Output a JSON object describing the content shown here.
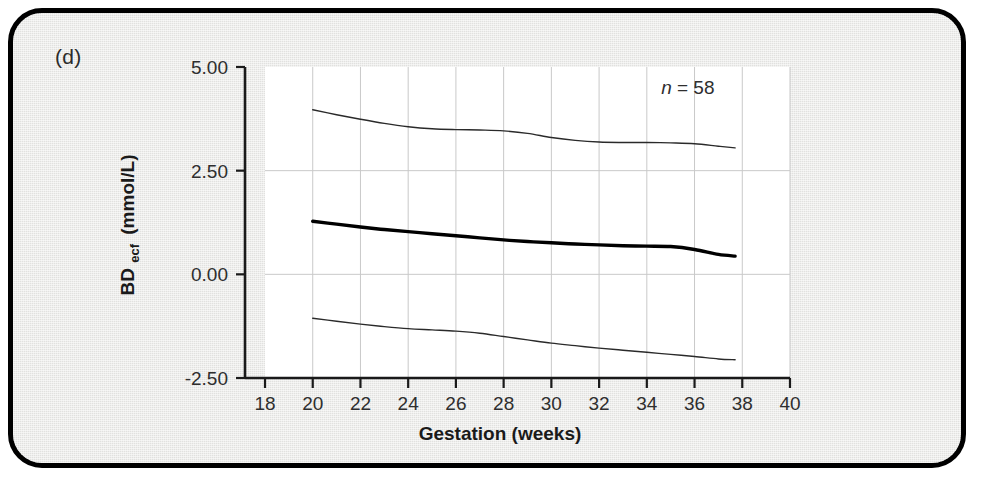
{
  "panel": {
    "label": "(d)",
    "background_color": "#e9e9e7",
    "border_color": "#000000",
    "plot_background_color": "#ffffff"
  },
  "chart_data": {
    "type": "line",
    "title": "",
    "subtitle": "",
    "xlabel": "Gestation (weeks)",
    "ylabel": "BD",
    "ylabel_subscript": "ecf",
    "ylabel_units": "(mmol/L)",
    "ylabel_full": "BD ecf (mmol/L)",
    "xlim": [
      18,
      40
    ],
    "ylim": [
      -2.5,
      5.0
    ],
    "xticks": [
      18,
      20,
      22,
      24,
      26,
      28,
      30,
      32,
      34,
      36,
      38,
      40
    ],
    "xtick_labels": [
      "18",
      "20",
      "22",
      "24",
      "26",
      "28",
      "30",
      "32",
      "34",
      "36",
      "38",
      "40"
    ],
    "yticks": [
      -2.5,
      0.0,
      2.5,
      5.0
    ],
    "ytick_labels": [
      "-2.50",
      "0.00",
      "2.50",
      "5.00"
    ],
    "grid": {
      "vertical": true,
      "horizontal": true,
      "horizontal_values": [
        0.0,
        2.5
      ],
      "color": "#c9c9c9"
    },
    "legend": {
      "visible": false,
      "position": "none"
    },
    "annotations": [
      {
        "name": "sample-size",
        "text_italic": "n",
        "text_rest": " = 58",
        "text": "n = 58",
        "x": 34.6,
        "y": 4.35
      }
    ],
    "x": [
      20.0,
      21.0,
      22.0,
      23.0,
      24.0,
      25.0,
      26.0,
      27.0,
      28.0,
      29.0,
      30.0,
      31.0,
      32.0,
      33.0,
      34.0,
      35.0,
      36.0,
      37.0,
      37.7
    ],
    "series": [
      {
        "name": "upper-centile",
        "label": "Upper reference limit",
        "style": "thin",
        "color": "#2a2a2a",
        "width": 1.4,
        "values": [
          3.97,
          3.85,
          3.74,
          3.64,
          3.56,
          3.51,
          3.49,
          3.48,
          3.46,
          3.4,
          3.3,
          3.23,
          3.19,
          3.18,
          3.18,
          3.17,
          3.15,
          3.09,
          3.05
        ]
      },
      {
        "name": "median",
        "label": "Median",
        "style": "thick",
        "color": "#000000",
        "width": 3.4,
        "values": [
          1.28,
          1.21,
          1.14,
          1.08,
          1.03,
          0.98,
          0.93,
          0.88,
          0.83,
          0.79,
          0.76,
          0.73,
          0.71,
          0.69,
          0.68,
          0.67,
          0.6,
          0.48,
          0.44
        ]
      },
      {
        "name": "lower-centile",
        "label": "Lower reference limit",
        "style": "thin",
        "color": "#2a2a2a",
        "width": 1.4,
        "values": [
          -1.06,
          -1.13,
          -1.2,
          -1.26,
          -1.31,
          -1.34,
          -1.37,
          -1.42,
          -1.5,
          -1.58,
          -1.66,
          -1.72,
          -1.78,
          -1.83,
          -1.88,
          -1.93,
          -1.98,
          -2.04,
          -2.06
        ]
      }
    ]
  }
}
